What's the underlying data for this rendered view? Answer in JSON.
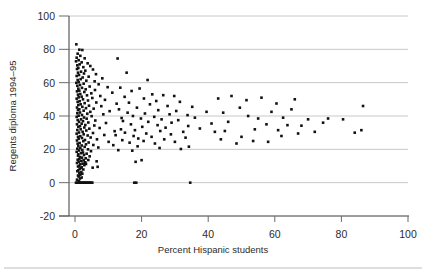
{
  "chart_data": {
    "type": "scatter",
    "title": "",
    "xlabel": "Percent Hispanic students",
    "ylabel": "Regents diploma 1994–95",
    "xlim": [
      -5,
      100
    ],
    "ylim": [
      -20,
      100
    ],
    "xticks": [
      0,
      20,
      40,
      60,
      80,
      100
    ],
    "yticks": [
      -20,
      0,
      20,
      40,
      60,
      80,
      100
    ],
    "xticklabels": [
      "0",
      "20",
      "40",
      "60",
      "80",
      "100"
    ],
    "yticklabels": [
      "-20",
      "0",
      "20",
      "40",
      "60",
      "80",
      "100"
    ],
    "grid": "horizontal",
    "legend": "none",
    "marker": "square",
    "marker_color": "#111111",
    "marker_size": 2.6,
    "points": [
      [
        0.4,
        83.0
      ],
      [
        1.3,
        79.8
      ],
      [
        2.2,
        79.6
      ],
      [
        0.8,
        77.4
      ],
      [
        1.6,
        76.1
      ],
      [
        0.5,
        75.0
      ],
      [
        2.9,
        74.6
      ],
      [
        1.1,
        73.5
      ],
      [
        0.3,
        72.8
      ],
      [
        2.0,
        72.2
      ],
      [
        3.8,
        71.6
      ],
      [
        1.4,
        71.0
      ],
      [
        0.7,
        70.4
      ],
      [
        4.6,
        70.0
      ],
      [
        2.5,
        69.3
      ],
      [
        1.0,
        68.8
      ],
      [
        0.6,
        68.2
      ],
      [
        5.4,
        67.9
      ],
      [
        3.1,
        67.2
      ],
      [
        1.8,
        66.6
      ],
      [
        0.9,
        66.0
      ],
      [
        2.7,
        65.5
      ],
      [
        6.3,
        65.1
      ],
      [
        1.2,
        64.6
      ],
      [
        0.5,
        64.0
      ],
      [
        4.1,
        63.6
      ],
      [
        2.3,
        63.1
      ],
      [
        8.2,
        62.6
      ],
      [
        1.7,
        62.1
      ],
      [
        0.8,
        61.6
      ],
      [
        3.4,
        61.2
      ],
      [
        5.9,
        60.8
      ],
      [
        1.1,
        60.3
      ],
      [
        0.4,
        59.9
      ],
      [
        2.6,
        59.4
      ],
      [
        7.1,
        59.0
      ],
      [
        1.5,
        58.6
      ],
      [
        0.7,
        58.1
      ],
      [
        4.4,
        57.7
      ],
      [
        9.8,
        57.3
      ],
      [
        2.1,
        56.9
      ],
      [
        1.0,
        56.4
      ],
      [
        3.2,
        56.0
      ],
      [
        6.0,
        55.6
      ],
      [
        1.3,
        55.2
      ],
      [
        0.6,
        54.8
      ],
      [
        2.8,
        54.4
      ],
      [
        11.2,
        54.0
      ],
      [
        4.9,
        53.6
      ],
      [
        1.6,
        53.2
      ],
      [
        0.9,
        52.8
      ],
      [
        3.6,
        52.4
      ],
      [
        7.6,
        52.0
      ],
      [
        2.0,
        51.6
      ],
      [
        1.1,
        51.2
      ],
      [
        5.2,
        50.8
      ],
      [
        0.5,
        50.4
      ],
      [
        2.4,
        50.0
      ],
      [
        9.0,
        49.7
      ],
      [
        3.9,
        49.3
      ],
      [
        1.4,
        48.9
      ],
      [
        0.8,
        48.5
      ],
      [
        6.4,
        48.1
      ],
      [
        2.9,
        47.7
      ],
      [
        12.5,
        47.4
      ],
      [
        1.7,
        47.0
      ],
      [
        1.0,
        46.6
      ],
      [
        4.2,
        46.2
      ],
      [
        7.9,
        45.9
      ],
      [
        2.2,
        45.5
      ],
      [
        0.6,
        45.1
      ],
      [
        3.3,
        44.7
      ],
      [
        5.6,
        44.4
      ],
      [
        1.3,
        44.0
      ],
      [
        0.9,
        43.6
      ],
      [
        2.6,
        43.2
      ],
      [
        10.4,
        42.9
      ],
      [
        4.6,
        42.5
      ],
      [
        1.5,
        42.1
      ],
      [
        0.7,
        41.7
      ],
      [
        3.7,
        41.4
      ],
      [
        8.5,
        41.0
      ],
      [
        2.1,
        40.6
      ],
      [
        1.1,
        40.2
      ],
      [
        5.0,
        39.9
      ],
      [
        0.5,
        39.5
      ],
      [
        2.7,
        39.1
      ],
      [
        14.0,
        38.8
      ],
      [
        3.5,
        38.4
      ],
      [
        1.8,
        38.0
      ],
      [
        0.8,
        37.6
      ],
      [
        6.1,
        37.3
      ],
      [
        2.4,
        36.9
      ],
      [
        1.2,
        36.5
      ],
      [
        4.0,
        36.1
      ],
      [
        9.3,
        35.8
      ],
      [
        2.0,
        35.4
      ],
      [
        0.6,
        35.0
      ],
      [
        3.1,
        34.6
      ],
      [
        5.8,
        34.3
      ],
      [
        1.5,
        33.9
      ],
      [
        1.0,
        33.5
      ],
      [
        2.8,
        33.1
      ],
      [
        7.4,
        32.8
      ],
      [
        4.3,
        32.4
      ],
      [
        1.7,
        32.0
      ],
      [
        0.7,
        31.6
      ],
      [
        3.4,
        31.3
      ],
      [
        11.9,
        30.9
      ],
      [
        2.3,
        30.5
      ],
      [
        1.2,
        30.1
      ],
      [
        5.4,
        29.8
      ],
      [
        0.5,
        29.4
      ],
      [
        2.6,
        29.0
      ],
      [
        8.8,
        28.6
      ],
      [
        3.8,
        28.3
      ],
      [
        1.6,
        27.9
      ],
      [
        0.9,
        27.5
      ],
      [
        4.7,
        27.1
      ],
      [
        2.1,
        26.8
      ],
      [
        1.1,
        26.4
      ],
      [
        6.6,
        26.0
      ],
      [
        3.0,
        25.6
      ],
      [
        0.6,
        25.3
      ],
      [
        2.5,
        24.9
      ],
      [
        10.1,
        24.5
      ],
      [
        4.1,
        24.1
      ],
      [
        1.4,
        23.8
      ],
      [
        0.8,
        23.4
      ],
      [
        3.3,
        23.0
      ],
      [
        5.5,
        22.6
      ],
      [
        2.0,
        22.3
      ],
      [
        1.0,
        21.9
      ],
      [
        2.9,
        21.5
      ],
      [
        7.0,
        21.1
      ],
      [
        1.6,
        20.8
      ],
      [
        0.7,
        20.4
      ],
      [
        3.9,
        20.0
      ],
      [
        2.2,
        19.6
      ],
      [
        1.2,
        19.3
      ],
      [
        4.8,
        18.9
      ],
      [
        0.5,
        18.5
      ],
      [
        2.4,
        18.1
      ],
      [
        1.8,
        17.7
      ],
      [
        3.5,
        17.4
      ],
      [
        1.0,
        17.0
      ],
      [
        2.7,
        16.6
      ],
      [
        0.9,
        16.2
      ],
      [
        4.4,
        15.8
      ],
      [
        1.5,
        15.4
      ],
      [
        2.1,
        15.0
      ],
      [
        3.2,
        14.6
      ],
      [
        1.3,
        14.2
      ],
      [
        0.8,
        13.8
      ],
      [
        2.6,
        13.4
      ],
      [
        1.9,
        13.0
      ],
      [
        1.1,
        12.6
      ],
      [
        3.0,
        12.2
      ],
      [
        0.6,
        11.8
      ],
      [
        2.3,
        11.4
      ],
      [
        1.6,
        11.0
      ],
      [
        2.8,
        10.5
      ],
      [
        1.2,
        10.1
      ],
      [
        0.9,
        9.7
      ],
      [
        2.0,
        9.2
      ],
      [
        1.7,
        8.8
      ],
      [
        1.4,
        8.3
      ],
      [
        2.5,
        7.9
      ],
      [
        1.0,
        7.4
      ],
      [
        0.7,
        6.9
      ],
      [
        1.9,
        6.4
      ],
      [
        1.3,
        5.9
      ],
      [
        2.2,
        5.4
      ],
      [
        1.6,
        4.8
      ],
      [
        0.9,
        4.3
      ],
      [
        1.1,
        3.7
      ],
      [
        2.0,
        3.1
      ],
      [
        1.5,
        2.5
      ],
      [
        0.6,
        1.8
      ],
      [
        1.2,
        1.0
      ],
      [
        0.3,
        0.0
      ],
      [
        0.7,
        0.0
      ],
      [
        1.0,
        0.0
      ],
      [
        1.3,
        0.0
      ],
      [
        1.6,
        0.0
      ],
      [
        1.9,
        0.0
      ],
      [
        2.2,
        0.0
      ],
      [
        2.5,
        0.0
      ],
      [
        2.8,
        0.0
      ],
      [
        3.1,
        0.0
      ],
      [
        3.4,
        0.0
      ],
      [
        3.7,
        0.0
      ],
      [
        4.0,
        0.0
      ],
      [
        4.3,
        0.0
      ],
      [
        4.6,
        0.0
      ],
      [
        4.9,
        0.0
      ],
      [
        5.2,
        0.0
      ],
      [
        17.8,
        0.0
      ],
      [
        18.4,
        0.0
      ],
      [
        34.6,
        0.0
      ],
      [
        5.3,
        9.0
      ],
      [
        6.8,
        9.5
      ],
      [
        3.3,
        11.2
      ],
      [
        3.1,
        12.0
      ],
      [
        4.0,
        13.6
      ],
      [
        12.8,
        74.5
      ],
      [
        15.5,
        66.0
      ],
      [
        21.8,
        61.6
      ],
      [
        13.6,
        57.0
      ],
      [
        19.4,
        56.5
      ],
      [
        17.0,
        55.0
      ],
      [
        23.2,
        53.0
      ],
      [
        26.5,
        52.5
      ],
      [
        29.8,
        52.0
      ],
      [
        14.9,
        51.5
      ],
      [
        20.7,
        50.5
      ],
      [
        24.4,
        49.0
      ],
      [
        31.5,
        48.5
      ],
      [
        16.2,
        48.0
      ],
      [
        22.5,
        47.0
      ],
      [
        27.8,
        46.0
      ],
      [
        35.2,
        45.5
      ],
      [
        18.6,
        45.0
      ],
      [
        13.2,
        44.0
      ],
      [
        25.0,
        43.5
      ],
      [
        30.4,
        43.0
      ],
      [
        39.5,
        42.5
      ],
      [
        15.8,
        42.0
      ],
      [
        21.0,
        41.5
      ],
      [
        28.4,
        41.0
      ],
      [
        33.8,
        40.5
      ],
      [
        17.4,
        40.0
      ],
      [
        23.8,
        39.5
      ],
      [
        36.0,
        39.0
      ],
      [
        19.8,
        38.5
      ],
      [
        26.0,
        38.0
      ],
      [
        31.0,
        37.5
      ],
      [
        14.4,
        37.0
      ],
      [
        22.0,
        36.5
      ],
      [
        29.0,
        36.0
      ],
      [
        41.0,
        35.5
      ],
      [
        16.8,
        35.0
      ],
      [
        24.8,
        34.5
      ],
      [
        34.0,
        34.0
      ],
      [
        20.2,
        33.5
      ],
      [
        27.2,
        33.0
      ],
      [
        37.5,
        32.5
      ],
      [
        13.8,
        32.0
      ],
      [
        18.0,
        31.5
      ],
      [
        25.6,
        31.0
      ],
      [
        32.5,
        30.5
      ],
      [
        15.0,
        30.0
      ],
      [
        21.4,
        29.5
      ],
      [
        28.8,
        29.0
      ],
      [
        12.2,
        28.5
      ],
      [
        17.6,
        28.0
      ],
      [
        23.0,
        27.5
      ],
      [
        33.2,
        27.0
      ],
      [
        19.0,
        26.5
      ],
      [
        26.8,
        26.0
      ],
      [
        14.2,
        25.5
      ],
      [
        20.6,
        25.0
      ],
      [
        30.0,
        24.5
      ],
      [
        16.4,
        24.0
      ],
      [
        24.0,
        23.5
      ],
      [
        11.5,
        22.5
      ],
      [
        18.8,
        21.8
      ],
      [
        25.4,
        20.8
      ],
      [
        31.8,
        20.2
      ],
      [
        34.2,
        21.6
      ],
      [
        13.0,
        19.5
      ],
      [
        17.2,
        19.2
      ],
      [
        20.0,
        13.5
      ],
      [
        18.2,
        12.5
      ],
      [
        6.5,
        12.8
      ],
      [
        44.5,
        42.0
      ],
      [
        46.0,
        36.5
      ],
      [
        49.5,
        45.0
      ],
      [
        52.0,
        40.0
      ],
      [
        55.0,
        38.5
      ],
      [
        57.5,
        35.0
      ],
      [
        59.0,
        42.5
      ],
      [
        62.5,
        39.0
      ],
      [
        63.8,
        34.5
      ],
      [
        65.0,
        44.0
      ],
      [
        68.0,
        34.2
      ],
      [
        70.0,
        38.0
      ],
      [
        74.5,
        36.0
      ],
      [
        76.0,
        38.5
      ],
      [
        80.5,
        38.0
      ],
      [
        84.0,
        30.0
      ],
      [
        86.0,
        31.5
      ],
      [
        86.5,
        46.0
      ],
      [
        43.0,
        50.5
      ],
      [
        47.0,
        52.0
      ],
      [
        51.5,
        49.5
      ],
      [
        56.0,
        51.0
      ],
      [
        60.5,
        47.5
      ],
      [
        66.0,
        50.0
      ],
      [
        43.8,
        26.0
      ],
      [
        48.5,
        23.5
      ],
      [
        50.0,
        27.5
      ],
      [
        53.5,
        25.0
      ],
      [
        58.0,
        24.5
      ],
      [
        62.0,
        28.0
      ],
      [
        42.0,
        30.5
      ],
      [
        45.0,
        31.0
      ],
      [
        54.0,
        32.0
      ],
      [
        61.0,
        31.5
      ],
      [
        67.0,
        29.5
      ],
      [
        72.0,
        30.5
      ]
    ]
  },
  "figure": {
    "bottom_rule": true
  }
}
